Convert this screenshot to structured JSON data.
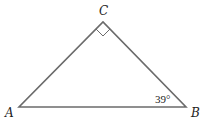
{
  "diagram": {
    "type": "right-triangle",
    "colors": {
      "stroke": "#6b6b6b",
      "text": "#222222",
      "background": "#ffffff"
    },
    "vertices": [
      {
        "label": "A",
        "x": 19,
        "y": 107
      },
      {
        "label": "B",
        "x": 186,
        "y": 107
      },
      {
        "label": "C",
        "x": 103,
        "y": 22
      }
    ],
    "right_angle_at": "C",
    "angle_labels": [
      {
        "at": "B",
        "text": "39°"
      }
    ]
  }
}
